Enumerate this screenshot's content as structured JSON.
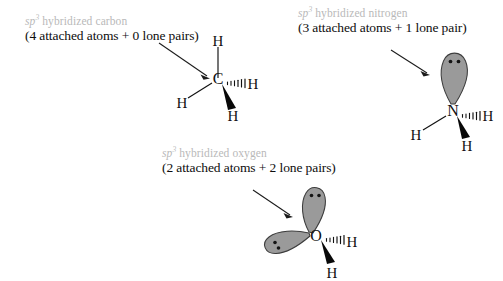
{
  "figure": {
    "background_color": "#ffffff",
    "heading_color": "#b9b9b9",
    "text_color": "#0d0d0d",
    "lobe_fill_color": "#999999",
    "lobe_stroke_color": "#3a3a3a",
    "bond_color": "#111111"
  },
  "panels": [
    {
      "id": "carbon",
      "heading_prefix": "sp",
      "heading_superscript": "3",
      "heading_suffix": " hybridized carbon",
      "subtitle": "(4 attached atoms + 0 lone pairs)",
      "center_atom": "C",
      "hydrogens": [
        {
          "label": "H",
          "bond": "plain",
          "position": "top"
        },
        {
          "label": "H",
          "bond": "plain",
          "position": "lower-left"
        },
        {
          "label": "H",
          "bond": "hashed",
          "position": "right"
        },
        {
          "label": "H",
          "bond": "wedge",
          "position": "lower-right"
        }
      ],
      "lone_pairs": 0,
      "attached_atoms": 4,
      "arrow": "points-to-center-atom"
    },
    {
      "id": "nitrogen",
      "heading_prefix": "sp",
      "heading_superscript": "3",
      "heading_suffix": " hybridized nitrogen",
      "subtitle": "(3 attached atoms + 1 lone pair)",
      "center_atom": "N",
      "hydrogens": [
        {
          "label": "H",
          "bond": "plain",
          "position": "lower-left"
        },
        {
          "label": "H",
          "bond": "hashed",
          "position": "right"
        },
        {
          "label": "H",
          "bond": "wedge",
          "position": "lower-right"
        }
      ],
      "lone_pairs": 1,
      "attached_atoms": 3,
      "arrow": "points-to-lone-pair-lobe"
    },
    {
      "id": "oxygen",
      "heading_prefix": "sp",
      "heading_superscript": "3",
      "heading_suffix": " hybridized oxygen",
      "subtitle": "(2 attached atoms + 2 lone pairs)",
      "center_atom": "O",
      "hydrogens": [
        {
          "label": "H",
          "bond": "hashed",
          "position": "right"
        },
        {
          "label": "H",
          "bond": "wedge",
          "position": "lower-right"
        }
      ],
      "lone_pairs": 2,
      "attached_atoms": 2,
      "arrow": "points-to-lone-pair-lobe"
    }
  ]
}
